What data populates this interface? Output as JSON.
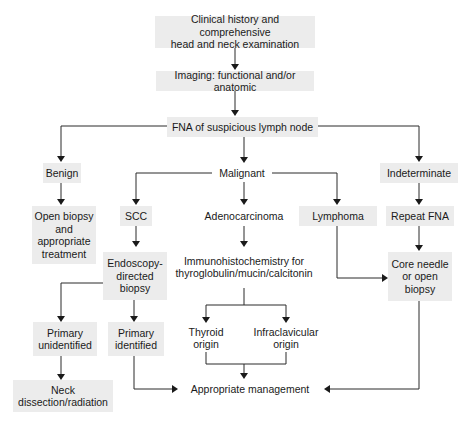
{
  "diagram": {
    "type": "flowchart",
    "nodes": {
      "clinical": "Clinical history and comprehensive\nhead and neck examination",
      "imaging": "Imaging: functional and/or anatomic",
      "fna": "FNA of suspicious lymph node",
      "benign": "Benign",
      "malignant": "Malignant",
      "indeterminate": "Indeterminate",
      "open_biopsy": "Open biopsy\nand\nappropriate\ntreatment",
      "scc": "SCC",
      "adeno": "Adenocarcinoma",
      "lymphoma": "Lymphoma",
      "repeat_fna": "Repeat FNA",
      "endoscopy": "Endoscopy-\ndirected\nbiopsy",
      "ihc": "Immunohistochemistry for\nthyroglobulin/mucin/calcitonin",
      "core_needle": "Core needle\nor open\nbiopsy",
      "primary_unidentified": "Primary\nunidentified",
      "primary_identified": "Primary\nidentified",
      "thyroid": "Thyroid\norigin",
      "infraclavicular": "Infraclavicular\norigin",
      "neck_dissection": "Neck\ndissection/radiation",
      "management": "Appropriate management"
    },
    "edges": [
      [
        "clinical",
        "imaging"
      ],
      [
        "imaging",
        "fna"
      ],
      [
        "fna",
        "benign"
      ],
      [
        "fna",
        "malignant"
      ],
      [
        "fna",
        "indeterminate"
      ],
      [
        "benign",
        "open_biopsy"
      ],
      [
        "malignant",
        "scc"
      ],
      [
        "malignant",
        "adeno"
      ],
      [
        "malignant",
        "lymphoma"
      ],
      [
        "indeterminate",
        "repeat_fna"
      ],
      [
        "scc",
        "endoscopy"
      ],
      [
        "adeno",
        "ihc"
      ],
      [
        "repeat_fna",
        "core_needle"
      ],
      [
        "lymphoma",
        "core_needle"
      ],
      [
        "endoscopy",
        "primary_unidentified"
      ],
      [
        "endoscopy",
        "primary_identified"
      ],
      [
        "ihc",
        "thyroid"
      ],
      [
        "ihc",
        "infraclavicular"
      ],
      [
        "primary_unidentified",
        "neck_dissection"
      ],
      [
        "primary_identified",
        "management"
      ],
      [
        "thyroid",
        "management"
      ],
      [
        "infraclavicular",
        "management"
      ],
      [
        "core_needle",
        "management"
      ]
    ],
    "colors": {
      "box_fill": "#ececec",
      "line": "#2a2a2a",
      "text": "#1a1a1a"
    }
  }
}
